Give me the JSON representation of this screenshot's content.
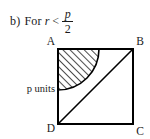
{
  "caption": {
    "label": "b)",
    "lead": "For",
    "variable": "r",
    "relation": "<",
    "fraction": {
      "numerator": "p",
      "denominator": "2"
    },
    "full_text": "b) For r < p/2"
  },
  "figure": {
    "type": "geometry-diagram",
    "shape": "square",
    "vertices": [
      {
        "name": "A",
        "label": "A",
        "position": "top-left"
      },
      {
        "name": "B",
        "label": "B",
        "position": "top-right"
      },
      {
        "name": "C",
        "label": "C",
        "position": "bottom-right"
      },
      {
        "name": "D",
        "label": "D",
        "position": "bottom-left"
      }
    ],
    "side_label": "p units",
    "side_label_position": "left",
    "diagonal": {
      "from": "D",
      "to": "B"
    },
    "shaded_region": {
      "description": "quarter-circle sector centred at A, hatched",
      "center": "A",
      "radius_symbol": "r",
      "fill": "diagonal-hatch",
      "hatch_color": "#000000"
    },
    "stroke_color": "#000000",
    "background": "#ffffff"
  }
}
